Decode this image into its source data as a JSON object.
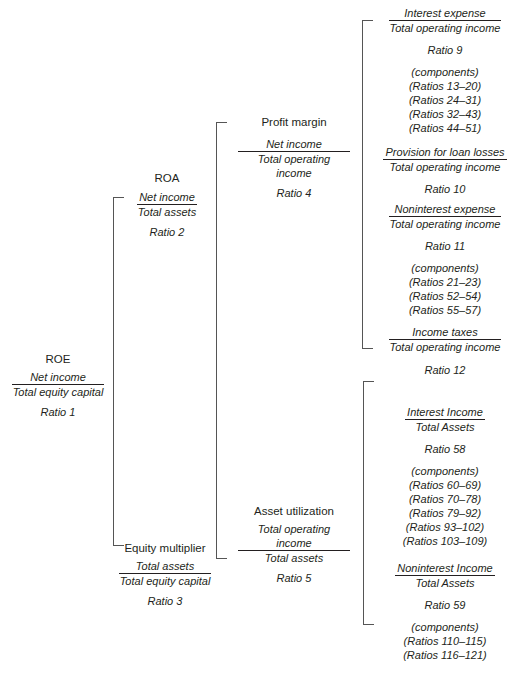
{
  "roe": {
    "title": "ROE",
    "numerator": "Net income",
    "denominator": "Total equity capital",
    "ratio": "Ratio 1"
  },
  "roa": {
    "title": "ROA",
    "numerator": "Net income",
    "denominator": "Total assets",
    "ratio": "Ratio 2"
  },
  "equity_multiplier": {
    "title": "Equity multiplier",
    "numerator": "Total assets",
    "denominator": "Total equity capital",
    "ratio": "Ratio 3"
  },
  "profit_margin": {
    "title": "Profit margin",
    "numerator": "Net income",
    "denominator": "Total operating income",
    "ratio": "Ratio 4"
  },
  "asset_utilization": {
    "title": "Asset utilization",
    "numerator": "Total operating income",
    "denominator": "Total assets",
    "ratio": "Ratio 5"
  },
  "interest_expense": {
    "numerator": "Interest expense",
    "denominator": "Total operating income",
    "ratio": "Ratio 9",
    "components": [
      "(components)",
      "(Ratios 13–20)",
      "(Ratios 24–31)",
      "(Ratios 32–43)",
      "(Ratios 44–51)"
    ]
  },
  "provision_loan_losses": {
    "numerator": "Provision for loan losses",
    "denominator": "Total operating income",
    "ratio": "Ratio 10"
  },
  "noninterest_expense": {
    "numerator": "Noninterest expense",
    "denominator": "Total operating income",
    "ratio": "Ratio 11",
    "components": [
      "(components)",
      "(Ratios 21–23)",
      "(Ratios 52–54)",
      "(Ratios 55–57)"
    ]
  },
  "income_taxes": {
    "numerator": "Income taxes",
    "denominator": "Total operating income",
    "ratio": "Ratio 12"
  },
  "interest_income": {
    "numerator": "Interest Income",
    "denominator": "Total Assets",
    "ratio": "Ratio 58",
    "components": [
      "(components)",
      "(Ratios 60–69)",
      "(Ratios 70–78)",
      "(Ratios 79–92)",
      "(Ratios 93–102)",
      "(Ratios 103–109)"
    ]
  },
  "noninterest_income": {
    "numerator": "Noninterest Income",
    "denominator": "Total Assets",
    "ratio": "Ratio 59",
    "components": [
      "(components)",
      "(Ratios 110–115)",
      "(Ratios 116–121)"
    ]
  }
}
